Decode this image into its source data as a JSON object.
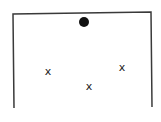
{
  "diagram": {
    "frame": {
      "color": "#3a3a3a",
      "stroke_width": 1.5,
      "top_left": [
        13,
        14
      ],
      "top_right": [
        151,
        12
      ],
      "bottom_left": [
        14,
        108
      ],
      "bottom_right": [
        152,
        107
      ]
    },
    "dot": {
      "cx": 84,
      "cy": 22,
      "r": 5,
      "color": "#111111"
    },
    "marks": [
      {
        "label": "x",
        "x": 48,
        "y": 71
      },
      {
        "label": "x",
        "x": 89,
        "y": 86
      },
      {
        "label": "x",
        "x": 122,
        "y": 67
      }
    ]
  }
}
